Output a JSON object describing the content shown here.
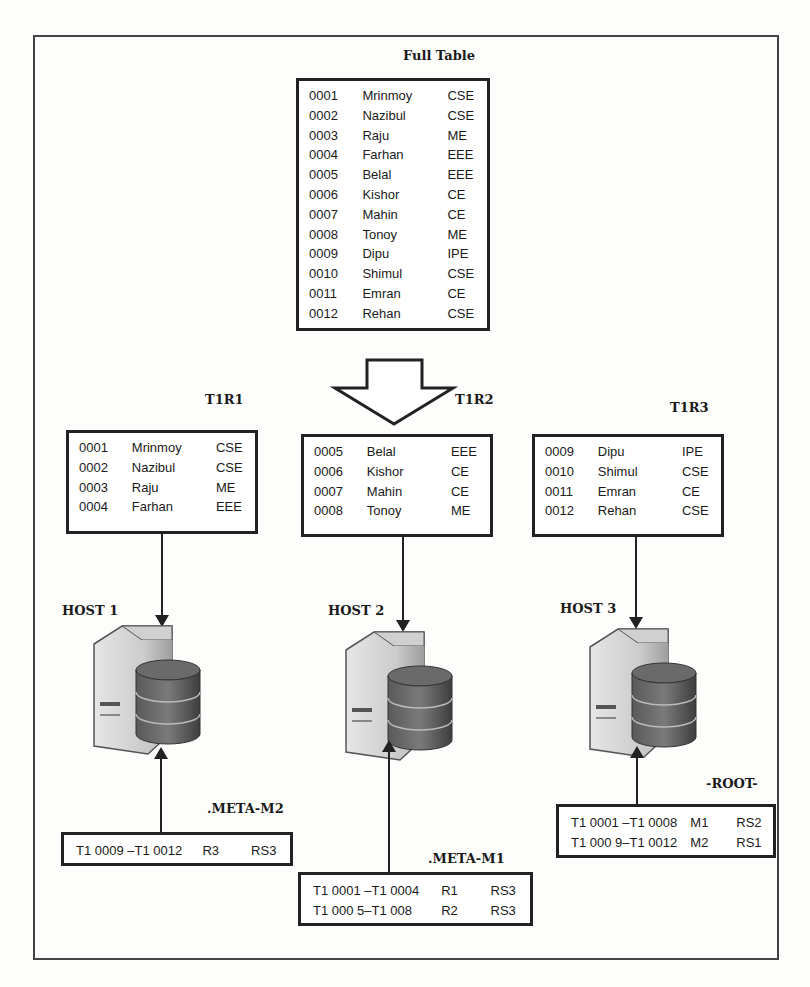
{
  "full_table": {
    "title": "Full Table",
    "rows": [
      {
        "id": "0001",
        "name": "Mrinmoy",
        "dept": "CSE"
      },
      {
        "id": "0002",
        "name": "Nazibul",
        "dept": "CSE"
      },
      {
        "id": "0003",
        "name": "Raju",
        "dept": "ME"
      },
      {
        "id": "0004",
        "name": "Farhan",
        "dept": "EEE"
      },
      {
        "id": "0005",
        "name": "Belal",
        "dept": "EEE"
      },
      {
        "id": "0006",
        "name": "Kishor",
        "dept": "CE"
      },
      {
        "id": "0007",
        "name": "Mahin",
        "dept": "CE"
      },
      {
        "id": "0008",
        "name": "Tonoy",
        "dept": "ME"
      },
      {
        "id": "0009",
        "name": "Dipu",
        "dept": "IPE"
      },
      {
        "id": "0010",
        "name": "Shimul",
        "dept": "CSE"
      },
      {
        "id": "0011",
        "name": "Emran",
        "dept": "CE"
      },
      {
        "id": "0012",
        "name": "Rehan",
        "dept": "CSE"
      }
    ]
  },
  "regions": [
    {
      "title": "T1R1",
      "rows": [
        {
          "id": "0001",
          "name": "Mrinmoy",
          "dept": "CSE"
        },
        {
          "id": "0002",
          "name": "Nazibul",
          "dept": "CSE"
        },
        {
          "id": "0003",
          "name": "Raju",
          "dept": "ME"
        },
        {
          "id": "0004",
          "name": "Farhan",
          "dept": "EEE"
        }
      ]
    },
    {
      "title": "T1R2",
      "rows": [
        {
          "id": "0005",
          "name": "Belal",
          "dept": "EEE"
        },
        {
          "id": "0006",
          "name": "Kishor",
          "dept": "CE"
        },
        {
          "id": "0007",
          "name": "Mahin",
          "dept": "CE"
        },
        {
          "id": "0008",
          "name": "Tonoy",
          "dept": "ME"
        }
      ]
    },
    {
      "title": "T1R3",
      "rows": [
        {
          "id": "0009",
          "name": "Dipu",
          "dept": "IPE"
        },
        {
          "id": "0010",
          "name": "Shimul",
          "dept": "CSE"
        },
        {
          "id": "0011",
          "name": "Emran",
          "dept": "CE"
        },
        {
          "id": "0012",
          "name": "Rehan",
          "dept": "CSE"
        }
      ]
    }
  ],
  "hosts": [
    {
      "label": "HOST 1"
    },
    {
      "label": "HOST 2"
    },
    {
      "label": "HOST 3"
    }
  ],
  "meta_tables": {
    "meta_m2": {
      "title": ".META-M2",
      "rows": [
        {
          "range": "T1 0009 –T1 0012",
          "region": "R3",
          "server": "RS3"
        }
      ]
    },
    "meta_m1": {
      "title": ".META-M1",
      "rows": [
        {
          "range": "T1 0001 –T1 0004",
          "region": "R1",
          "server": "RS3"
        },
        {
          "range": "T1 000 5–T1 008",
          "region": "R2",
          "server": "RS3"
        }
      ]
    },
    "root": {
      "title": "-ROOT-",
      "rows": [
        {
          "range": "T1 0001 –T1 0008",
          "region": "M1",
          "server": "RS2"
        },
        {
          "range": "T1 000 9–T1 0012",
          "region": "M2",
          "server": "RS1"
        }
      ]
    }
  },
  "colors": {
    "line": "#222222",
    "server_light": "#d9d9d9",
    "server_mid": "#a8a8a8",
    "db_dark": "#4a4a4a",
    "db_mid": "#6e6e6e"
  }
}
